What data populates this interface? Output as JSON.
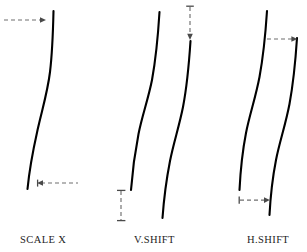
{
  "figure": {
    "background_color": "#ffffff",
    "curve_color": "#000000",
    "annotation_color": "#6f6f6f",
    "label_color": "#1d1d1d",
    "width": 307,
    "height": 252
  },
  "panels": [
    {
      "id": "scale-x",
      "label": "SCALE X",
      "label_x": 20,
      "label_y": 243,
      "curves": [
        {
          "name": "base-curve",
          "path": "M 53.5 11 C 53.0 33 52.4 52 50.0 72 C 47.6 92 42.0 110 38.0 128 C 34.0 146 30.0 163 27.5 189"
        }
      ],
      "annotations": [
        {
          "name": "top-right-arrow",
          "type": "dashed-arrow",
          "direction": "right",
          "tail_x": 4,
          "head_x": 46,
          "y": 20
        },
        {
          "name": "bottom-left-arrow",
          "type": "dashed-arrow",
          "direction": "left",
          "tail_x": 78,
          "head_x": 38,
          "y": 183
        }
      ]
    },
    {
      "id": "v-shift",
      "label": "V.SHIFT",
      "label_x": 134,
      "label_y": 243,
      "curves": [
        {
          "name": "base-curve",
          "path": "M 159.5 12 C 158.0 36 156.0 58 152.0 80 C 148.0 100 142.0 116 138.5 134 C 135.0 152 132.5 170 131.0 190"
        },
        {
          "name": "shifted-curve",
          "path": "M 190.5 41 C 189.0 64 187.0 86 183.0 107 C 179.0 127 173.5 143 170.0 161 C 166.5 179 164.0 197 162.5 218"
        }
      ],
      "annotations": [
        {
          "name": "top-down-arrow",
          "type": "dashed-arrow-vertical",
          "direction": "down",
          "x": 190,
          "tail_y": 6,
          "head_y": 40,
          "tick": "top"
        },
        {
          "name": "bottom-dimension",
          "type": "dashed-dimension-vertical",
          "x": 121,
          "top_y": 190,
          "bottom_y": 221
        }
      ]
    },
    {
      "id": "h-shift",
      "label": "H.SHIFT",
      "label_x": 247,
      "label_y": 243,
      "curves": [
        {
          "name": "base-curve",
          "path": "M 267.0 11 C 265.5 34 263.5 55 259.5 77 C 255.5 98 249.5 115 246.0 133 C 242.5 151 240.5 170 239.5 190"
        },
        {
          "name": "shifted-curve",
          "path": "M 297.0 38 C 295.5 61 293.5 82 289.5 104 C 285.5 125 279.5 142 276.0 160 C 272.5 178 270.5 196 269.5 215"
        }
      ],
      "annotations": [
        {
          "name": "top-right-arrow",
          "type": "dashed-arrow",
          "direction": "right",
          "tail_x": 266,
          "head_x": 297,
          "y": 39,
          "tick": "left"
        },
        {
          "name": "bottom-dimension",
          "type": "dashed-dimension-horizontal",
          "left_x": 239,
          "right_x": 270,
          "y": 200
        }
      ]
    }
  ]
}
